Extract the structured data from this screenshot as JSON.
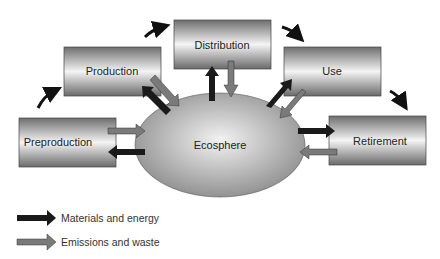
{
  "diagram": {
    "center": "Ecosphere",
    "stages": [
      {
        "id": "preproduction",
        "label": "Preproduction"
      },
      {
        "id": "production",
        "label": "Production"
      },
      {
        "id": "distribution",
        "label": "Distribution"
      },
      {
        "id": "use",
        "label": "Use"
      },
      {
        "id": "retirement",
        "label": "Retirement"
      }
    ],
    "legend": [
      {
        "label": "Materials and energy",
        "color": "#1a1a1a"
      },
      {
        "label": "Emissions and waste",
        "color": "#7a7a7a"
      }
    ]
  }
}
